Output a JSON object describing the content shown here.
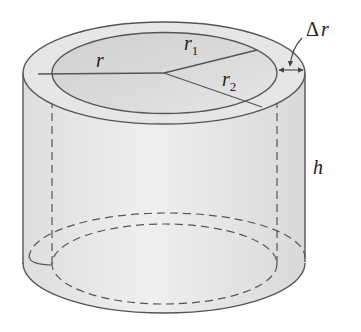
{
  "diagram": {
    "labels": {
      "radius": {
        "symbol": "r"
      },
      "inner_radius": {
        "symbol": "r",
        "subscript": "1"
      },
      "outer_radius": {
        "symbol": "r",
        "subscript": "2"
      },
      "thickness": {
        "delta": "Δ",
        "symbol": "r"
      },
      "height": {
        "symbol": "h"
      }
    },
    "colors": {
      "stroke": "#555555",
      "shell_fill": "#e4e4e4",
      "inner_top_fill": "#d6d6d6",
      "body_fill": "#e9e9e9",
      "background": "#ffffff"
    }
  }
}
